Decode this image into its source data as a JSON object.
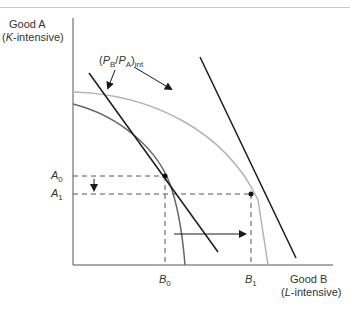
{
  "figure": {
    "y_axis": {
      "label_line1": "Good A",
      "label_line2_italic": "K",
      "label_line2_rest": "-intensive)"
    },
    "x_axis": {
      "label_line1": "Good B",
      "label_line2_italic": "L",
      "label_line2_rest": "-intensive)"
    },
    "price_label": {
      "open": "(",
      "pb": "P",
      "pb_sub": "B",
      "slash": "/",
      "pa": "P",
      "pa_sub": "A",
      "close": ")",
      "sub": "int"
    },
    "ticks": {
      "A0": {
        "letter": "A",
        "sub": "0"
      },
      "A1": {
        "letter": "A",
        "sub": "1"
      },
      "B0": {
        "letter": "B",
        "sub": "0"
      },
      "B1": {
        "letter": "B",
        "sub": "1"
      }
    },
    "colors": {
      "axis": "#555555",
      "ppf_initial": "#666666",
      "ppf_new": "#b5b5b5",
      "price_line": "#1a1a1a",
      "dashed": "#555555"
    }
  }
}
